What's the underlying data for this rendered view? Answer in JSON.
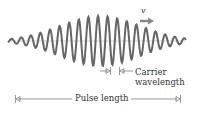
{
  "diagram": {
    "velocity_label": "v",
    "carrier_label_line1": "Carrier",
    "carrier_label_line2": "wavelength",
    "pulse_label": "Pulse length",
    "colors": {
      "wave": "#666666",
      "axis": "#999999",
      "arrow": "#888888",
      "text": "#333333"
    },
    "wave": {
      "x_start": 8,
      "x_end": 186,
      "center_y": 41,
      "max_amplitude": 25,
      "carrier_period_px": 9.6,
      "envelope_center_x": 100,
      "envelope_width_px": 40
    }
  }
}
